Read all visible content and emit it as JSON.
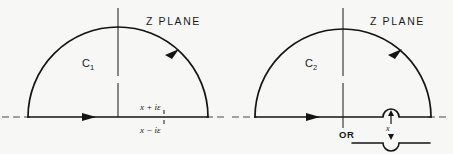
{
  "figure": {
    "background_color": "#f7f7f5",
    "ink_color": "#141414",
    "width": 453,
    "height": 154
  },
  "panels": [
    {
      "id": "panel-left",
      "plane_label": "Z PLANE",
      "contour_label": "C",
      "contour_subscript": "1",
      "pole_label_upper": "x + iε",
      "pole_label_lower": "x − iε",
      "contour_type": "upper-half-plane-semicircle",
      "direction": "counterclockwise"
    },
    {
      "id": "panel-right",
      "plane_label": "Z PLANE",
      "contour_label": "C",
      "contour_subscript": "2",
      "or_label": "OR",
      "pole_label": "x",
      "contour_type": "upper-half-plane-semicircle-with-indentation",
      "direction": "counterclockwise",
      "alt_contour_label": "x"
    }
  ]
}
